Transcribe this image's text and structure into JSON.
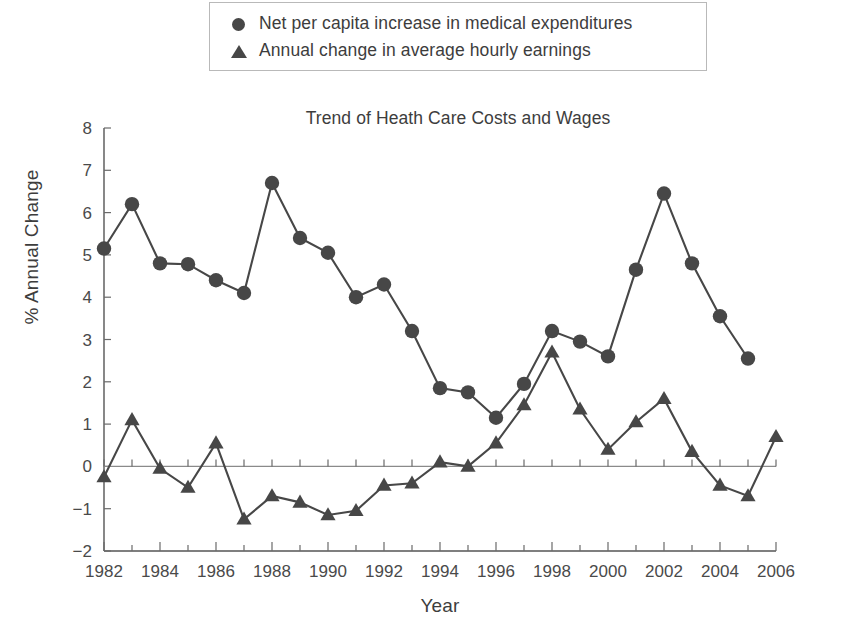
{
  "legend": {
    "position": "top",
    "items": [
      {
        "marker": "circle-marker-icon",
        "label": "Net per capita increase in medical expenditures"
      },
      {
        "marker": "triangle-marker-icon",
        "label": "Annual change in average hourly earnings"
      }
    ]
  },
  "axes": {
    "x_title": "Year",
    "y_title": "% Annual Change"
  },
  "colors": {
    "series": "#474747",
    "axis": "#555555",
    "text": "#3d3d3d"
  },
  "chart_data": {
    "type": "line",
    "title": "Trend of Heath Care Costs and Wages",
    "xlabel": "Year",
    "ylabel": "% Annual Change",
    "xlim": [
      1982,
      2006
    ],
    "ylim": [
      -2,
      8
    ],
    "ytick_step": 1,
    "yticks": [
      -2,
      -1,
      0,
      1,
      2,
      3,
      4,
      5,
      6,
      7,
      8
    ],
    "xticks_major": [
      1982,
      1984,
      1986,
      1988,
      1990,
      1992,
      1994,
      1996,
      1998,
      2000,
      2002,
      2004,
      2006
    ],
    "xticks_minor_every": 1,
    "grid": false,
    "legend_position": "above-plot",
    "series": [
      {
        "name": "Net per capita increase in medical expenditures",
        "marker": "circle",
        "x": [
          1982,
          1983,
          1984,
          1985,
          1986,
          1987,
          1988,
          1989,
          1990,
          1991,
          1992,
          1993,
          1994,
          1995,
          1996,
          1997,
          1998,
          1999,
          2000,
          2001,
          2002,
          2003,
          2004,
          2005
        ],
        "values": [
          5.15,
          6.2,
          4.8,
          4.78,
          4.4,
          4.1,
          6.7,
          5.4,
          5.05,
          4.0,
          4.3,
          3.2,
          1.85,
          1.75,
          1.15,
          1.95,
          3.2,
          2.95,
          2.6,
          4.65,
          6.45,
          4.8,
          3.55,
          2.55
        ]
      },
      {
        "name": "Annual change in average hourly earnings",
        "marker": "triangle",
        "x": [
          1982,
          1983,
          1984,
          1985,
          1986,
          1987,
          1988,
          1989,
          1990,
          1991,
          1992,
          1993,
          1994,
          1995,
          1996,
          1997,
          1998,
          1999,
          2000,
          2001,
          2002,
          2003,
          2004,
          2005,
          2006
        ],
        "values": [
          -0.25,
          1.1,
          -0.05,
          -0.5,
          0.55,
          -1.25,
          -0.7,
          -0.85,
          -1.15,
          -1.05,
          -0.45,
          -0.4,
          0.1,
          0.0,
          0.55,
          1.45,
          2.7,
          1.35,
          0.4,
          1.05,
          1.6,
          0.35,
          -0.45,
          -0.7,
          0.7
        ]
      }
    ]
  }
}
